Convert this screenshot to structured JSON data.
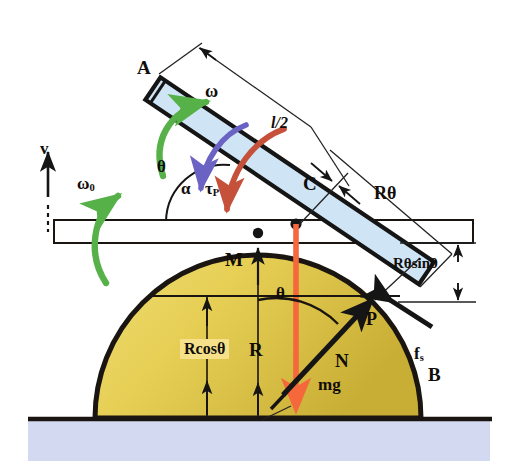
{
  "figure": {
    "type": "physics-free-body-diagram"
  },
  "colors": {
    "rod_fill": "#cfe4f5",
    "rod_outline": "#151515",
    "dome_fill": "#e7cf55",
    "dome_fill_dark": "#cfb53b",
    "dome_outline": "#1a1510",
    "ground_fill": "#d2d9f0",
    "ground_line": "#1a1510",
    "omega_arrow": "#56b149",
    "omega0_arrow": "#56b149",
    "tau_arrow": "#6b63c4",
    "alpha_arrow": "#c5513a",
    "mg_arrow": "#f4683c",
    "highlight": "#f6e08a",
    "dim_line": "#222222"
  },
  "labels": {
    "rod_top_end": "A",
    "rod_bottom_end": "B",
    "contact_point": "C",
    "dome_apex": "M",
    "rod_dome_contact": "P",
    "angular_velocity_rod": "ω",
    "angular_velocity_bar": "ω",
    "angular_velocity_bar_sub": "0",
    "angular_acceleration": "α",
    "torque": "τ",
    "torque_sub": "P",
    "velocity": "v",
    "angle_upper": "θ",
    "angle_lower": "θ",
    "half_length": "l/2",
    "arc_length": "Rθ",
    "vertical_drop": "Rθsinθ",
    "height_label": "Rcosθ",
    "radius": "R",
    "normal_force": "N",
    "weight": "mg",
    "friction_force": "f",
    "friction_sub": "s"
  },
  "geometry": {
    "rod": {
      "start": "A",
      "end": "B",
      "angle_deg": 34
    },
    "dome": {
      "center_x": 258,
      "base_y": 418,
      "radius": 163
    },
    "bar": {
      "left_x": 54,
      "right_x": 473,
      "top_y": 220,
      "bottom_y": 243
    }
  }
}
